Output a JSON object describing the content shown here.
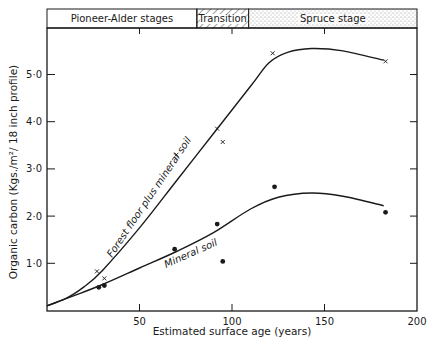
{
  "chart_data": {
    "type": "line",
    "title": "",
    "xlabel": "Estimated surface age (years)",
    "ylabel": "Organic carbon (Kgs./m²/18 inch profile)",
    "xlim": [
      0,
      200
    ],
    "ylim": [
      0,
      5.9
    ],
    "x_ticks": [
      50,
      100,
      150,
      200
    ],
    "x_tick_labels": [
      "50",
      "100",
      "150",
      "200"
    ],
    "y_ticks": [
      1.0,
      2.0,
      3.0,
      4.0,
      5.0
    ],
    "y_tick_labels": [
      "1·0",
      "2·0",
      "3·0",
      "4·0",
      "5·0"
    ],
    "grid": false,
    "legend_position": "none (curves labelled inline)",
    "stage_band": [
      {
        "label": "Pioneer-Alder stages",
        "x_start": 0,
        "x_end": 81,
        "fill": "plain"
      },
      {
        "label": "Transition",
        "x_start": 81,
        "x_end": 109,
        "fill": "hatched"
      },
      {
        "label": "Spruce stage",
        "x_start": 109,
        "x_end": 200,
        "fill": "stippled"
      }
    ],
    "series": [
      {
        "name": "Forest floor plus mineral soil",
        "marker": "x",
        "points": [
          {
            "x": 27,
            "y": 0.83
          },
          {
            "x": 31,
            "y": 0.68
          },
          {
            "x": 70,
            "y": 3.3
          },
          {
            "x": 92,
            "y": 3.85
          },
          {
            "x": 95,
            "y": 3.57
          },
          {
            "x": 122,
            "y": 5.45
          },
          {
            "x": 183,
            "y": 5.28
          }
        ],
        "fitted_curve": [
          {
            "x": 0,
            "y": 0.1
          },
          {
            "x": 10,
            "y": 0.25
          },
          {
            "x": 20,
            "y": 0.5
          },
          {
            "x": 30,
            "y": 0.85
          },
          {
            "x": 50,
            "y": 1.75
          },
          {
            "x": 70,
            "y": 2.75
          },
          {
            "x": 90,
            "y": 3.75
          },
          {
            "x": 110,
            "y": 4.75
          },
          {
            "x": 120,
            "y": 5.25
          },
          {
            "x": 130,
            "y": 5.47
          },
          {
            "x": 143,
            "y": 5.55
          },
          {
            "x": 160,
            "y": 5.5
          },
          {
            "x": 182,
            "y": 5.3
          }
        ]
      },
      {
        "name": "Mineral soil",
        "marker": "dot",
        "points": [
          {
            "x": 28,
            "y": 0.49
          },
          {
            "x": 31,
            "y": 0.53
          },
          {
            "x": 69,
            "y": 1.3
          },
          {
            "x": 92,
            "y": 1.83
          },
          {
            "x": 95,
            "y": 1.04
          },
          {
            "x": 123,
            "y": 2.62
          },
          {
            "x": 183,
            "y": 2.08
          }
        ],
        "fitted_curve": [
          {
            "x": 0,
            "y": 0.1
          },
          {
            "x": 15,
            "y": 0.32
          },
          {
            "x": 30,
            "y": 0.55
          },
          {
            "x": 50,
            "y": 0.9
          },
          {
            "x": 70,
            "y": 1.25
          },
          {
            "x": 90,
            "y": 1.65
          },
          {
            "x": 110,
            "y": 2.15
          },
          {
            "x": 125,
            "y": 2.4
          },
          {
            "x": 143,
            "y": 2.49
          },
          {
            "x": 160,
            "y": 2.42
          },
          {
            "x": 182,
            "y": 2.22
          }
        ]
      }
    ]
  },
  "labels": {
    "band_pioneer": "Pioneer-Alder  stages",
    "band_transition": "Transition",
    "band_spruce": "Spruce  stage",
    "curve_upper": "Forest  floor  plus  mineral  soil",
    "curve_lower": "Mineral  soil",
    "xlabel": "Estimated  surface  age  (years)",
    "ylabel": "Organic  carbon  (Kgs./m²/ 18 inch profile)"
  },
  "colors": {
    "ink": "#1a1a1a",
    "background": "#ffffff",
    "stipple": "#9a9a9a"
  }
}
